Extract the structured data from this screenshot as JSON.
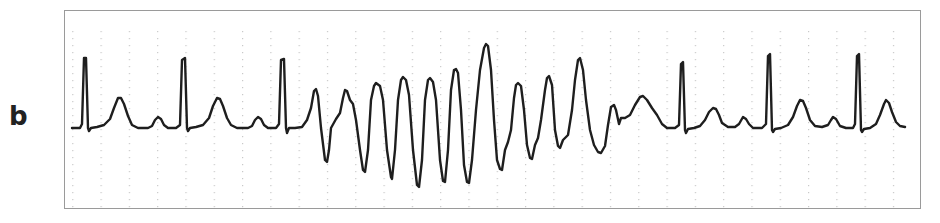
{
  "panel": {
    "label": "b"
  },
  "colors": {
    "trace": "#1e1e1e",
    "border": "#9a9a9a",
    "grid_dots": "#b8b8b8",
    "background": "#ffffff"
  },
  "chart_data": {
    "type": "line",
    "title": "",
    "subtitle": "ECG rhythm strip (panel b): sinus beats, a run of polymorphic ventricular tachycardia (torsades-like, twisting amplitude), then return to sinus rhythm",
    "xlabel": "",
    "ylabel": "",
    "grid": "faint dotted vertical markers",
    "legend": "none",
    "axis_ranges": {
      "x": [
        64,
        921
      ],
      "y": [
        10,
        209
      ]
    },
    "baseline_y_px": 127,
    "segments": [
      {
        "name": "sinus beat 1",
        "r_peak": [
          84,
          58
        ],
        "t_peak": [
          119,
          98
        ],
        "p_peak": [
          158,
          117
        ]
      },
      {
        "name": "sinus beat 2",
        "r_peak": [
          183,
          58
        ],
        "t_peak": [
          217,
          98
        ],
        "p_peak": [
          258,
          117
        ]
      },
      {
        "name": "sinus beat 3",
        "r_peak": [
          282,
          59
        ]
      },
      {
        "name": "polymorphic VT run",
        "peaks": [
          [
            314,
            89
          ],
          [
            345,
            90
          ],
          [
            376,
            83
          ],
          [
            403,
            77
          ],
          [
            429,
            78
          ],
          [
            455,
            69
          ],
          [
            486,
            44
          ],
          [
            518,
            83
          ],
          [
            549,
            76
          ],
          [
            578,
            58
          ],
          [
            611,
            105
          ]
        ],
        "troughs": [
          [
            325,
            162
          ],
          [
            363,
            172
          ],
          [
            391,
            179
          ],
          [
            417,
            187
          ],
          [
            443,
            182
          ],
          [
            467,
            183
          ],
          [
            500,
            170
          ],
          [
            530,
            159
          ],
          [
            558,
            148
          ],
          [
            598,
            153
          ]
        ]
      },
      {
        "name": "recovery hump",
        "peak": [
          641,
          96
        ]
      },
      {
        "name": "sinus beat 4",
        "r_peak": [
          681,
          62
        ],
        "t_peak": [
          713,
          108
        ],
        "p_peak": [
          743,
          117
        ]
      },
      {
        "name": "sinus beat 5",
        "r_peak": [
          768,
          54
        ],
        "t_peak": [
          800,
          100
        ],
        "p_peak": [
          833,
          117
        ]
      },
      {
        "name": "sinus beat 6",
        "r_peak": [
          857,
          54
        ],
        "t_peak": [
          886,
          100
        ]
      }
    ],
    "points": "72,128 80,128 82,124 84,58 86,58 88,128 89,131 91,128 97,127 104,125 110,119 114,108 118,98 121,98 124,104 128,116 132,125 138,128 148,128 152,126 155,120 158,117 161,119 164,125 168,128 176,128 180,125 182,60 185,58 187,128 188,131 190,128 196,127 203,125 209,118 213,106 217,98 220,99 223,106 227,118 231,125 237,128 248,128 252,126 255,120 258,117 261,119 264,125 268,128 276,128 279,124 281,60 284,59 286,128 287,133 289,128 295,128 302,127 307,120 311,108 314,91 316,89 318,96 321,128 325,160 327,162 329,150 331,128 336,119 340,113 343,98 345,90 347,91 350,100 353,104 356,120 360,150 363,170 365,172 368,150 371,100 374,86 376,83 380,86 383,100 387,150 391,177 392,179 395,150 398,100 401,80 403,77 406,80 409,95 413,150 417,185 419,187 422,160 425,100 428,80 430,78 433,82 436,100 440,160 443,181 445,182 448,150 451,90 454,70 456,69 458,73 461,110 464,165 467,182 469,183 472,160 476,110 480,70 484,48 486,44 488,46 491,70 494,120 497,160 500,169 502,170 505,150 508,142 511,130 514,98 516,85 518,83 521,86 524,110 527,145 530,158 532,159 535,145 538,138 541,120 545,90 547,78 549,76 552,85 555,130 558,146 560,148 563,140 568,135 572,110 575,80 578,60 580,58 583,70 586,100 590,130 594,145 598,152 601,153 605,146 608,125 611,107 614,105 616,110 619,124 621,118 625,118 630,115 635,105 640,97 643,96 647,100 652,108 657,115 662,124 667,128 675,128 679,125 681,64 683,62 685,130 686,133 688,129 694,128 700,126 705,120 709,112 713,108 716,109 719,115 722,123 728,127 735,127 739,124 743,117 746,119 749,124 753,128 762,128 766,124 768,56 770,54 772,130 773,132 775,129 781,128 788,125 793,117 797,106 800,100 803,101 806,108 810,120 815,126 822,127 828,125 831,120 833,117 836,119 840,126 846,128 853,128 855,124 857,56 859,54 861,130 862,132 864,129 870,128 876,124 880,115 884,104 886,100 889,103 892,112 896,122 900,126 905,127"
  }
}
